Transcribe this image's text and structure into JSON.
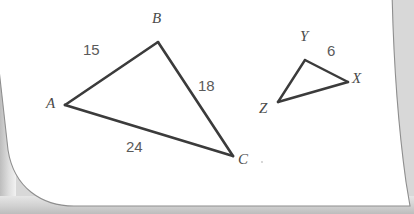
{
  "figure": {
    "type": "geometry-diagram",
    "stroke_color": "#3b3b3b",
    "label_color": "#4a4a4a",
    "side_label_color": "#5a5a5a",
    "page_color": "#ffffff",
    "shadow_color": "#c9c9c9"
  },
  "triangles": [
    {
      "name": "triangle-abc",
      "vertices": [
        {
          "id": "A",
          "label": "A",
          "x": 65,
          "y": 105,
          "label_x": 46,
          "label_y": 98
        },
        {
          "id": "B",
          "label": "B",
          "x": 158,
          "y": 42,
          "label_x": 152,
          "label_y": 14
        },
        {
          "id": "C",
          "label": "C",
          "x": 233,
          "y": 156,
          "label_x": 238,
          "label_y": 155
        }
      ],
      "sides": [
        {
          "from": "A",
          "to": "B",
          "label": "15",
          "label_x": 83,
          "label_y": 44
        },
        {
          "from": "B",
          "to": "C",
          "label": "18",
          "label_x": 198,
          "label_y": 80
        },
        {
          "from": "A",
          "to": "C",
          "label": "24",
          "label_x": 126,
          "label_y": 141
        }
      ]
    },
    {
      "name": "triangle-xyz",
      "vertices": [
        {
          "id": "Y",
          "label": "Y",
          "x": 305,
          "y": 60,
          "label_x": 300,
          "label_y": 32
        },
        {
          "id": "X",
          "label": "X",
          "x": 348,
          "y": 82,
          "label_x": 353,
          "label_y": 74
        },
        {
          "id": "Z",
          "label": "Z",
          "x": 278,
          "y": 102,
          "label_x": 259,
          "label_y": 103
        }
      ],
      "sides": [
        {
          "from": "Y",
          "to": "X",
          "label": "6",
          "label_x": 327,
          "label_y": 45
        },
        {
          "from": "X",
          "to": "Z",
          "label": "",
          "label_x": 0,
          "label_y": 0
        },
        {
          "from": "Z",
          "to": "Y",
          "label": "",
          "label_x": 0,
          "label_y": 0
        }
      ]
    }
  ],
  "labels": {
    "a": "A",
    "b": "B",
    "c": "C",
    "x": "X",
    "y": "Y",
    "z": "Z",
    "ab": "15",
    "bc": "18",
    "ac": "24",
    "yx": "6"
  }
}
